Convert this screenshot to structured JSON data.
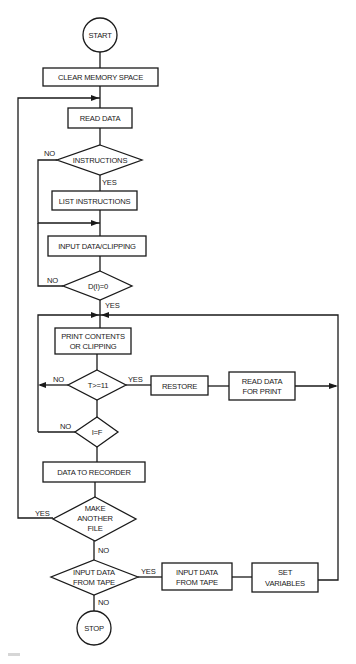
{
  "diagram": {
    "type": "flowchart",
    "terminals": {
      "start": "START",
      "stop": "STOP"
    },
    "processes": {
      "clear_memory": "CLEAR MEMORY SPACE",
      "read_data": "READ DATA",
      "list_instructions": "LIST INSTRUCTIONS",
      "input_data_clipping": "INPUT DATA/CLIPPING",
      "print_contents_l1": "PRINT CONTENTS",
      "print_contents_l2": "OR CLIPPING",
      "restore": "RESTORE",
      "read_data_print_l1": "READ DATA",
      "read_data_print_l2": "FOR PRINT",
      "data_to_recorder": "DATA TO RECORDER",
      "input_from_tape_l1": "INPUT DATA",
      "input_from_tape_l2": "FROM TAPE",
      "set_variables_l1": "SET",
      "set_variables_l2": "VARIABLES"
    },
    "decisions": {
      "instructions": "INSTRUCTIONS",
      "d_i_zero": "D(I)=0",
      "t_ge_11": "T>=11",
      "i_eq_f": "I=F",
      "make_another_l1": "MAKE",
      "make_another_l2": "ANOTHER",
      "make_another_l3": "FILE",
      "input_tape_q_l1": "INPUT DATA",
      "input_tape_q_l2": "FROM TAPE"
    },
    "branch_labels": {
      "yes": "YES",
      "no": "NO"
    },
    "colors": {
      "stroke": "#1a1a1a",
      "background": "#ffffff"
    }
  }
}
